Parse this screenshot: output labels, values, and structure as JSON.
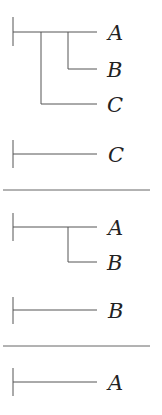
{
  "diagram": {
    "type": "tree-decomposition",
    "line_color": "#555555",
    "text_color": "#222222",
    "panels": [
      {
        "name": "full-tree",
        "labels": [
          "A",
          "B",
          "C"
        ],
        "structure": "((A,B),C)"
      },
      {
        "name": "subtree-c",
        "labels": [
          "C"
        ],
        "structure": "C"
      },
      {
        "name": "subtree-ab",
        "labels": [
          "A",
          "B"
        ],
        "structure": "(A,B)"
      },
      {
        "name": "subtree-b",
        "labels": [
          "B"
        ],
        "structure": "B"
      },
      {
        "name": "subtree-a",
        "labels": [
          "A"
        ],
        "structure": "A"
      }
    ],
    "separators": 2
  }
}
